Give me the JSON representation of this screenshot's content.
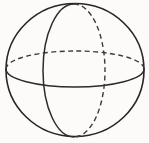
{
  "figure": {
    "name": "sphere-wireframe",
    "title": "Sphere with equator and meridian great circles",
    "background_color": "#fcfbfa",
    "stroke_color": "#2b2b2b",
    "dashed_stroke_color": "#3a3a3a",
    "canvas": {
      "width": 149,
      "height": 143
    }
  },
  "geometry": {
    "outline": {
      "label": "sphere-outline",
      "shape": "circle",
      "center_x": 75,
      "center_y": 70,
      "radius_x": 69,
      "radius_y": 66.5,
      "style": "solid"
    },
    "equator": {
      "label": "equator-great-circle",
      "shape": "ellipse",
      "center_x": 75,
      "center_y": 69,
      "radius_x": 69,
      "radius_y": 18,
      "rotation_deg": 0,
      "front_half_style": "solid",
      "back_half_style": "dashed"
    },
    "meridian": {
      "label": "meridian-great-circle",
      "shape": "ellipse",
      "center_x": 74,
      "center_y": 70.5,
      "radius_x": 31,
      "radius_y": 66.5,
      "rotation_deg": 0,
      "front_half_style": "solid",
      "back_half_style": "dashed"
    },
    "poles": {
      "north_pole_x": 74,
      "north_pole_y": 4,
      "south_pole_x": 74,
      "south_pole_y": 137
    }
  },
  "paths": {
    "outline_d": "M 6 70 A 69 66.5 0 1 1 144 70 A 69 66.5 0 1 1 6 70 Z",
    "equator_back_d": "M 6 69 A 69 18 0 0 1 144 69",
    "equator_front_d": "M 144 69 A 69 18 0 0 1 6 69",
    "meridian_front_d": "M 74 4 A 31 66.5 0 0 0 74 137",
    "meridian_back_d": "M 74 4 A 31 66.5 0 0 1 74 137"
  }
}
